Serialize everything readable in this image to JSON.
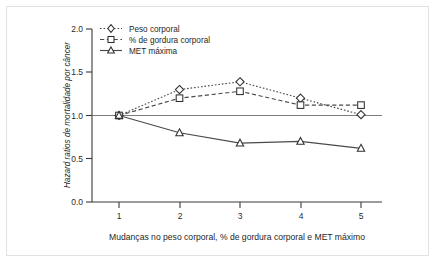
{
  "chart_data": {
    "type": "line",
    "title": "",
    "xlabel": "Mudanças no peso corporal, % de gordura corporal e MET máximo",
    "ylabel": "Hazard ratios de mortalidade por câncer",
    "x": [
      1,
      2,
      3,
      4,
      5
    ],
    "xticklabels": [
      "1",
      "2",
      "3",
      "4",
      "5"
    ],
    "yticklabels": [
      "0.0",
      "0.5",
      "1.0",
      "1.5",
      "2.0"
    ],
    "yticks": [
      0.0,
      0.5,
      1.0,
      1.5,
      2.0
    ],
    "ylim": [
      0.0,
      2.0
    ],
    "xlim": [
      0.6,
      5.5
    ],
    "grid": false,
    "legend_position": "top-left",
    "reference_line": 1.0,
    "series": [
      {
        "name": "Peso corporal",
        "values": [
          1.0,
          1.3,
          1.39,
          1.2,
          1.01
        ],
        "marker": "diamond",
        "linestyle": "dotted",
        "color": "#4a4a4a"
      },
      {
        "name": "% de gordura corporal",
        "values": [
          1.0,
          1.2,
          1.28,
          1.12,
          1.12
        ],
        "marker": "square",
        "linestyle": "dashed",
        "color": "#4a4a4a"
      },
      {
        "name": "MET máxima",
        "values": [
          1.0,
          0.8,
          0.68,
          0.7,
          0.62
        ],
        "marker": "triangle",
        "linestyle": "solid",
        "color": "#4a4a4a"
      }
    ]
  },
  "legend": {
    "items": [
      {
        "label": "Peso corporal"
      },
      {
        "label": "% de gordura corporal"
      },
      {
        "label": "MET máxima"
      }
    ]
  },
  "axes": {
    "x_title": "Mudanças no peso corporal, % de gordura corporal e MET máximo",
    "y_title": "Hazard ratios de mortalidade por câncer",
    "x_ticks": [
      "1",
      "2",
      "3",
      "4",
      "5"
    ],
    "y_ticks": [
      "0.0",
      "0.5",
      "1.0",
      "1.5",
      "2.0"
    ]
  },
  "colors": {
    "line": "#4a4a4a",
    "axis": "#3a3a3a",
    "text": "#1f1f1f",
    "frame": "#e2e2e2",
    "background": "#ffffff"
  }
}
